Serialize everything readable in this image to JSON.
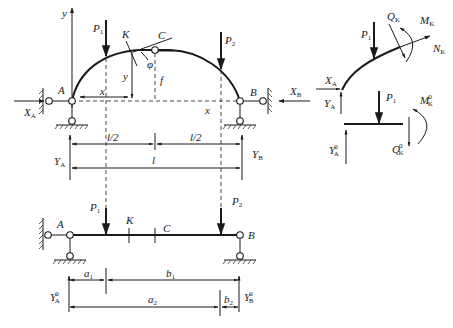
{
  "figure": {
    "top_arch": {
      "support_left": "A",
      "support_right": "B",
      "crown_hinge": "C",
      "section": "K",
      "loads": [
        "P",
        "P"
      ],
      "load_subs": [
        "1",
        "2"
      ],
      "reactions": {
        "XA": {
          "main": "X",
          "sub": "A"
        },
        "XB": {
          "main": "X",
          "sub": "B"
        },
        "YA": {
          "main": "Y",
          "sub": "A"
        },
        "YB": {
          "main": "Y",
          "sub": "B"
        }
      },
      "axis_y": "y",
      "axis_x": "x",
      "coord_x": "x",
      "coord_y": "y",
      "rise": "f",
      "angle": "φ",
      "half_span_left": "l/2",
      "half_span_right": "l/2",
      "span": "l"
    },
    "free_body_arch": {
      "load": {
        "main": "P",
        "sub": "1"
      },
      "shear": {
        "main": "Q",
        "sub": "K"
      },
      "moment": {
        "main": "M",
        "sub": "K"
      },
      "normal": {
        "main": "N",
        "sub": "K"
      },
      "XA": {
        "main": "X",
        "sub": "A"
      },
      "YA": {
        "main": "Y",
        "sub": "A"
      }
    },
    "free_body_beam": {
      "load": {
        "main": "P",
        "sub": "1"
      },
      "moment": {
        "main": "M",
        "sub": "K",
        "sup": "0"
      },
      "shear": {
        "main": "Q",
        "sub": "K",
        "sup": "0"
      },
      "YA": {
        "main": "Y",
        "sub": "A",
        "sup": "0"
      }
    },
    "bottom_beam": {
      "support_left": "A",
      "support_right": "B",
      "section": "K",
      "point_c": "C",
      "loads": [
        {
          "main": "P",
          "sub": "1"
        },
        {
          "main": "P",
          "sub": "2"
        }
      ],
      "dims": {
        "a1": {
          "main": "a",
          "sub": "1"
        },
        "b1": {
          "main": "b",
          "sub": "1"
        },
        "a2": {
          "main": "a",
          "sub": "2"
        },
        "b2": {
          "main": "b",
          "sub": "2"
        }
      },
      "YA0": {
        "main": "Y",
        "sub": "A",
        "sup": "0"
      },
      "YB0": {
        "main": "Y",
        "sub": "B",
        "sup": "0"
      }
    }
  }
}
